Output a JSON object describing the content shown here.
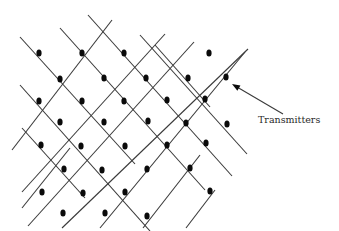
{
  "diagram": {
    "label": "Transmitters",
    "line_color": "#3a3a3a",
    "dot_color": "#0a0a0a",
    "lines_down": [
      [
        20,
        37,
        135,
        164
      ],
      [
        60,
        28,
        205,
        190
      ],
      [
        88,
        15,
        232,
        176
      ],
      [
        140,
        35,
        247,
        154
      ],
      [
        20,
        85,
        150,
        231
      ],
      [
        22,
        128,
        85,
        198
      ],
      [
        155,
        45,
        210,
        107
      ]
    ],
    "lines_up": [
      [
        12,
        150,
        112,
        20
      ],
      [
        22,
        192,
        165,
        34
      ],
      [
        28,
        226,
        194,
        42
      ],
      [
        62,
        228,
        248,
        49
      ],
      [
        100,
        228,
        245,
        52
      ],
      [
        143,
        228,
        200,
        155
      ],
      [
        186,
        228,
        215,
        190
      ],
      [
        22,
        208,
        70,
        148
      ]
    ],
    "dots": [
      [
        39,
        53
      ],
      [
        82,
        53
      ],
      [
        124,
        53
      ],
      [
        209,
        53
      ],
      [
        60,
        79
      ],
      [
        104,
        78
      ],
      [
        146,
        78
      ],
      [
        188,
        78
      ],
      [
        226,
        77
      ],
      [
        39,
        101
      ],
      [
        82,
        101
      ],
      [
        124,
        101
      ],
      [
        167,
        100
      ],
      [
        205,
        99
      ],
      [
        60,
        122
      ],
      [
        104,
        122
      ],
      [
        148,
        121
      ],
      [
        186,
        123
      ],
      [
        227,
        124
      ],
      [
        41,
        145
      ],
      [
        81,
        146
      ],
      [
        125,
        146
      ],
      [
        167,
        145
      ],
      [
        206,
        143
      ],
      [
        64,
        169
      ],
      [
        102,
        170
      ],
      [
        147,
        169
      ],
      [
        190,
        168
      ],
      [
        42,
        192
      ],
      [
        83,
        193
      ],
      [
        125,
        192
      ],
      [
        210,
        191
      ],
      [
        63,
        213
      ],
      [
        105,
        213
      ],
      [
        147,
        216
      ]
    ],
    "arrow": {
      "x1": 283,
      "y1": 114,
      "x2": 232,
      "y2": 84
    }
  }
}
